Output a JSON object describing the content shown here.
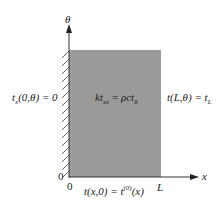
{
  "diagram": {
    "type": "boundary-value-problem-domain",
    "domain_fill": "#9a9a9a",
    "axes": {
      "vertical_label": "θ",
      "horizontal_label": "x",
      "origin_x_label": "0",
      "origin_y_label": "0",
      "x_end_label": "L"
    },
    "equation": {
      "lhs": "kt",
      "lhs_sub": "xx",
      "eq": " = ",
      "rhs": "ρct",
      "rhs_sub": "θ"
    },
    "boundary_conditions": {
      "left": {
        "main": "t",
        "sub": "x",
        "args": "(0,θ) = 0"
      },
      "right": {
        "main": "t(L,θ) = t",
        "sub": "L"
      },
      "bottom": {
        "main": "t(x,0) = t",
        "sup": "(0)",
        "tail": "(x)"
      }
    }
  }
}
